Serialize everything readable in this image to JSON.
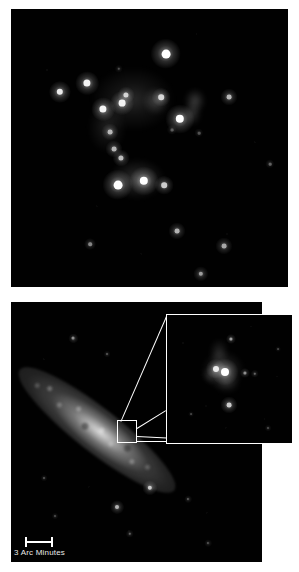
{
  "figure": {
    "background_color": "#ffffff",
    "width": 299,
    "height": 572,
    "panel_count": 2
  },
  "top_panel": {
    "name": "star-cluster-field",
    "background_color": "#000000",
    "bounds": {
      "x": 11,
      "y": 9,
      "width": 277,
      "height": 278
    },
    "description": "Deep black astronomical field containing a loose cluster of resolved point sources with faint diffuse nebulosity",
    "stars": [
      {
        "x": 155,
        "y": 45,
        "r": 4.4,
        "brightness": 1.0
      },
      {
        "x": 76,
        "y": 74,
        "r": 3.6,
        "brightness": 0.95
      },
      {
        "x": 49,
        "y": 83,
        "r": 3.2,
        "brightness": 0.92
      },
      {
        "x": 115,
        "y": 86,
        "r": 2.6,
        "brightness": 0.8
      },
      {
        "x": 111,
        "y": 94,
        "r": 3.4,
        "brightness": 0.95
      },
      {
        "x": 150,
        "y": 88,
        "r": 2.8,
        "brightness": 0.82
      },
      {
        "x": 218,
        "y": 88,
        "r": 2.4,
        "brightness": 0.72
      },
      {
        "x": 92,
        "y": 100,
        "r": 3.6,
        "brightness": 0.96
      },
      {
        "x": 169,
        "y": 110,
        "r": 4.2,
        "brightness": 1.0
      },
      {
        "x": 99,
        "y": 123,
        "r": 2.4,
        "brightness": 0.7
      },
      {
        "x": 103,
        "y": 140,
        "r": 2.4,
        "brightness": 0.7
      },
      {
        "x": 110,
        "y": 149,
        "r": 2.6,
        "brightness": 0.74
      },
      {
        "x": 133,
        "y": 172,
        "r": 4.2,
        "brightness": 1.0
      },
      {
        "x": 107,
        "y": 176,
        "r": 4.4,
        "brightness": 1.0
      },
      {
        "x": 153,
        "y": 176,
        "r": 2.8,
        "brightness": 0.8
      },
      {
        "x": 166,
        "y": 222,
        "r": 2.4,
        "brightness": 0.7
      },
      {
        "x": 79,
        "y": 235,
        "r": 1.8,
        "brightness": 0.52
      },
      {
        "x": 213,
        "y": 237,
        "r": 2.4,
        "brightness": 0.66
      },
      {
        "x": 190,
        "y": 265,
        "r": 2.2,
        "brightness": 0.62
      },
      {
        "x": 259,
        "y": 155,
        "r": 1.3,
        "brightness": 0.38
      },
      {
        "x": 108,
        "y": 60,
        "r": 1.2,
        "brightness": 0.3
      },
      {
        "x": 161,
        "y": 121,
        "r": 1.4,
        "brightness": 0.34
      },
      {
        "x": 188,
        "y": 124,
        "r": 1.3,
        "brightness": 0.32
      }
    ],
    "nebulosity": [
      {
        "x": 122,
        "y": 90,
        "w": 86,
        "h": 66,
        "opacity": 0.16
      },
      {
        "x": 145,
        "y": 92,
        "w": 26,
        "h": 28,
        "opacity": 0.24
      },
      {
        "x": 184,
        "y": 92,
        "w": 22,
        "h": 26,
        "opacity": 0.26
      },
      {
        "x": 181,
        "y": 105,
        "w": 20,
        "h": 24,
        "opacity": 0.22
      },
      {
        "x": 126,
        "y": 170,
        "w": 58,
        "h": 42,
        "opacity": 0.22
      },
      {
        "x": 96,
        "y": 118,
        "w": 40,
        "h": 54,
        "opacity": 0.13
      }
    ]
  },
  "bottom_panel": {
    "name": "edge-on-galaxy-field",
    "background_color": "#000000",
    "bounds": {
      "x": 11,
      "y": 302,
      "width": 251,
      "height": 260
    },
    "description": "Wide-field view of an edge-on spiral galaxy oriented diagonally from upper-left to lower-right, with a boxed region of interest magnified in an inset",
    "galaxy": {
      "name": "edge-on-spiral-disk",
      "center_x": 86,
      "center_y": 128,
      "length": 196,
      "thickness": 44,
      "angle_deg": 38
    },
    "field_stars": [
      {
        "x": 62,
        "y": 36,
        "r": 1.5,
        "brightness": 0.55
      },
      {
        "x": 96,
        "y": 52,
        "r": 1.0,
        "brightness": 0.34
      },
      {
        "x": 177,
        "y": 197,
        "r": 1.1,
        "brightness": 0.36
      },
      {
        "x": 139,
        "y": 186,
        "r": 2.2,
        "brightness": 0.78
      },
      {
        "x": 106,
        "y": 205,
        "r": 2.0,
        "brightness": 0.7
      },
      {
        "x": 119,
        "y": 232,
        "r": 1.2,
        "brightness": 0.38
      },
      {
        "x": 33,
        "y": 176,
        "r": 1.0,
        "brightness": 0.32
      },
      {
        "x": 206,
        "y": 118,
        "r": 1.0,
        "brightness": 0.3
      },
      {
        "x": 44,
        "y": 214,
        "r": 1.0,
        "brightness": 0.3
      },
      {
        "x": 197,
        "y": 241,
        "r": 1.1,
        "brightness": 0.33
      }
    ],
    "source_box": {
      "name": "region-of-interest-box",
      "x": 117,
      "y": 420,
      "width": 20,
      "height": 23,
      "stroke_color": "#ffffff"
    },
    "connectors": [
      {
        "name": "connector-upper",
        "x1": 121,
        "y1": 421,
        "x2": 167,
        "y2": 315
      },
      {
        "name": "connector-middle",
        "x1": 137,
        "y1": 428,
        "x2": 166,
        "y2": 410
      },
      {
        "name": "connector-lower",
        "x1": 137,
        "y1": 441,
        "x2": 293,
        "y2": 441
      },
      {
        "name": "connector-lower-inner",
        "x1": 137,
        "y1": 436,
        "x2": 293,
        "y2": 444
      }
    ],
    "scale_bar": {
      "name": "angular-scale-bar",
      "label": "3 Arc Minutes",
      "color": "#ffffff",
      "bar_x": 25,
      "bar_y": 541,
      "bar_length": 28
    }
  },
  "inset_panel": {
    "name": "magnified-region-inset",
    "background_color": "#000000",
    "border_color": "#ffffff",
    "bounds": {
      "x": 166,
      "y": 314,
      "width": 127,
      "height": 130
    },
    "description": "High-resolution magnification of the boxed region showing a bright double knot embedded in faint nebulosity",
    "stars": [
      {
        "x": 64,
        "y": 24,
        "r": 1.6,
        "brightness": 0.62
      },
      {
        "x": 58,
        "y": 57,
        "r": 4.0,
        "brightness": 1.0
      },
      {
        "x": 49,
        "y": 54,
        "r": 3.0,
        "brightness": 0.9
      },
      {
        "x": 78,
        "y": 58,
        "r": 1.6,
        "brightness": 0.56
      },
      {
        "x": 88,
        "y": 59,
        "r": 1.2,
        "brightness": 0.4
      },
      {
        "x": 62,
        "y": 90,
        "r": 2.4,
        "brightness": 0.8
      },
      {
        "x": 101,
        "y": 113,
        "r": 1.0,
        "brightness": 0.3
      },
      {
        "x": 24,
        "y": 99,
        "r": 0.9,
        "brightness": 0.26
      },
      {
        "x": 111,
        "y": 34,
        "r": 0.9,
        "brightness": 0.26
      }
    ],
    "nebulosity": [
      {
        "x": 56,
        "y": 55,
        "w": 44,
        "h": 40,
        "opacity": 0.22
      },
      {
        "x": 52,
        "y": 38,
        "w": 20,
        "h": 30,
        "opacity": 0.18
      },
      {
        "x": 60,
        "y": 68,
        "w": 28,
        "h": 22,
        "opacity": 0.16
      },
      {
        "x": 44,
        "y": 60,
        "w": 18,
        "h": 18,
        "opacity": 0.2
      }
    ]
  }
}
